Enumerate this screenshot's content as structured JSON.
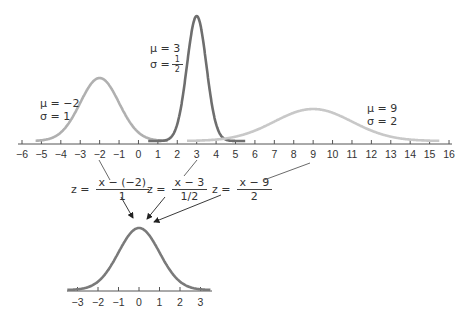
{
  "chart_data": {
    "type": "line",
    "top_axis": {
      "min": -6,
      "max": 16,
      "ticks": [
        -6,
        -5,
        -4,
        -3,
        -2,
        -1,
        0,
        1,
        2,
        3,
        4,
        5,
        6,
        7,
        8,
        9,
        10,
        11,
        12,
        13,
        14,
        15,
        16
      ]
    },
    "series": [
      {
        "name": "N(-2,1)",
        "mu": -2,
        "sigma": 1,
        "label_mu": "μ = −2",
        "label_sigma": "σ = 1",
        "color": "#b0b0b0"
      },
      {
        "name": "N(3,1/2)",
        "mu": 3,
        "sigma": 0.5,
        "label_mu": "μ = 3",
        "label_sigma": "σ = ",
        "sigma_frac": {
          "num": "1",
          "den": "2"
        },
        "color": "#6e6e6e"
      },
      {
        "name": "N(9,2)",
        "mu": 9,
        "sigma": 2,
        "label_mu": "μ = 9",
        "label_sigma": "σ = 2",
        "color": "#c8c8c8"
      }
    ],
    "transforms": [
      {
        "lhs": "z =",
        "num": "x − (−2)",
        "den": "1"
      },
      {
        "lhs": "z =",
        "num": "x − 3",
        "den": "1/2"
      },
      {
        "lhs": "z =",
        "num": "x − 9",
        "den": "2"
      }
    ],
    "bottom_axis": {
      "min": -3,
      "max": 3,
      "ticks": [
        -3,
        -2,
        -1,
        0,
        1,
        2,
        3
      ]
    },
    "standard": {
      "mu": 0,
      "sigma": 1,
      "color": "#7a7a7a"
    }
  },
  "labels": {
    "s1_mu": "μ = −2",
    "s1_sigma": "σ = 1",
    "s2_mu": "μ = 3",
    "s2_sigma": "σ =",
    "s2_num": "1",
    "s2_den": "2",
    "s3_mu": "μ = 9",
    "s3_sigma": "σ = 2",
    "f1_lhs": "z =",
    "f1_num": "x − (−2)",
    "f1_den": "1",
    "f2_lhs": "z =",
    "f2_num": "x − 3",
    "f2_den": "1/2",
    "f3_lhs": "z =",
    "f3_num": "x − 9",
    "f3_den": "2"
  },
  "top_ticks": [
    "−6",
    "−5",
    "−4",
    "−3",
    "−2",
    "−1",
    "0",
    "1",
    "2",
    "3",
    "4",
    "5",
    "6",
    "7",
    "8",
    "9",
    "10",
    "11",
    "12",
    "13",
    "14",
    "15",
    "16"
  ],
  "bottom_ticks": [
    "−3",
    "−2",
    "−1",
    "0",
    "1",
    "2",
    "3"
  ]
}
